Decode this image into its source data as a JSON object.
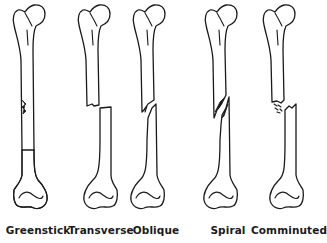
{
  "diagram": {
    "line_color": "#1a1a1a",
    "background": "#ffffff",
    "fractures": [
      {
        "label": "Greenstick",
        "center_x": 38
      },
      {
        "label": "Transverse",
        "center_x": 101
      },
      {
        "label": "Oblique",
        "center_x": 156
      },
      {
        "label": "Spiral",
        "center_x": 228
      },
      {
        "label": "Comminuted",
        "center_x": 289
      }
    ]
  }
}
